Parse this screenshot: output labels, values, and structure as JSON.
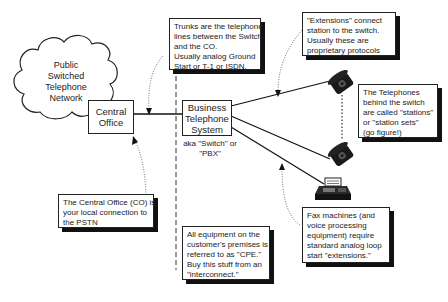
{
  "diagram": {
    "cloud": {
      "lines": [
        "Public",
        "Switched",
        "Telephone",
        "Network"
      ]
    },
    "central_office": {
      "lines": [
        "Central",
        "Office"
      ]
    },
    "pbx": {
      "lines": [
        "Business",
        "Telephone",
        "System"
      ],
      "aka": [
        "aka \"Switch\" or",
        "\"PBX\""
      ]
    },
    "notes": {
      "trunks": [
        "Trunks are the telephone",
        "lines between the Switch",
        "and the CO.",
        "Usually analog Ground",
        "Start or T-1 or ISDN."
      ],
      "extensions": [
        "\"Extensions\" connect",
        "station to the switch.",
        "Usually these are",
        "proprietary protocols"
      ],
      "stations": [
        "The Telephones",
        "behind the switch",
        "are called \"stations\"",
        "or \"station sets\"",
        "(go figure!)"
      ],
      "central_office": [
        "The Central Office (CO) is",
        "your local connection to",
        "the PSTN"
      ],
      "cpe": [
        "All equipment on the",
        "customer's premises is",
        "referred to as \"CPE.\"",
        "Buy this stuff from an",
        "\"interconnect.\""
      ],
      "fax": [
        "Fax machines (and",
        "voice processing",
        "equipment) require",
        "standard analog loop",
        "start \"extensions.\""
      ]
    },
    "devices": [
      {
        "type": "telephone",
        "icon": "telephone-icon"
      },
      {
        "type": "telephone",
        "icon": "telephone-icon"
      },
      {
        "type": "fax",
        "icon": "fax-machine-icon"
      }
    ]
  }
}
